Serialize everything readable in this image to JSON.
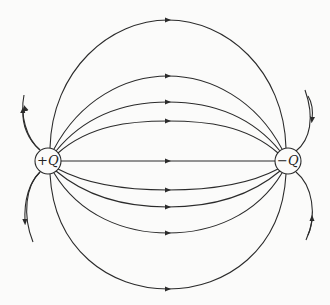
{
  "diagram": {
    "charges": [
      {
        "id": "positive",
        "label": "+Q",
        "cx": 48,
        "cy": 161
      },
      {
        "id": "negative",
        "label": "−Q",
        "cx": 288,
        "cy": 161
      }
    ],
    "stroke_color": "#2b2b2b",
    "background": "#fbfbfa"
  }
}
